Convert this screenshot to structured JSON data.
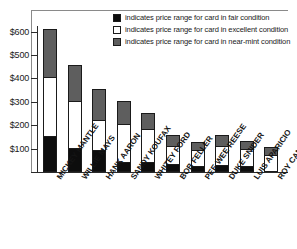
{
  "chart_data": {
    "type": "bar",
    "title": "",
    "subtitle": "",
    "xlabel": "",
    "ylabel": "",
    "stacked": true,
    "grid": false,
    "ylim": [
      0,
      640
    ],
    "yticks": [
      100,
      200,
      300,
      400,
      500,
      600
    ],
    "ytick_labels": [
      "$100",
      "$200",
      "$300",
      "$400",
      "$500",
      "$600"
    ],
    "legend_position": "top-right-inside",
    "categories": [
      "MICKEY MANTLE",
      "WILLIE MAYS",
      "HANK AARON",
      "SANDY KOUFAX",
      "WHITEY FORD",
      "BOB FELLER",
      "PEE WEE REESE",
      "DUKE SNIDER",
      "LUIS APARICIO",
      "ROY CAMPANELLA"
    ],
    "series": [
      {
        "name": "fair",
        "label": "indicates price range for card in fair condition",
        "color": "#0d0d0d",
        "values": [
          150,
          100,
          90,
          38,
          38,
          28,
          22,
          25,
          20,
          0
        ]
      },
      {
        "name": "excellent",
        "label": "indicates price range for card in excellent condition",
        "color": "#ffffff",
        "values": [
          250,
          200,
          130,
          162,
          142,
          77,
          68,
          80,
          75,
          70
        ]
      },
      {
        "name": "near-mint",
        "label": "indicates price range for card in near-mint condition",
        "color": "#5e5e5e",
        "values": [
          205,
          155,
          130,
          100,
          70,
          47,
          35,
          50,
          33,
          33
        ]
      }
    ],
    "cumulative_tops": [
      [
        150,
        400,
        605
      ],
      [
        100,
        300,
        455
      ],
      [
        90,
        220,
        350
      ],
      [
        38,
        200,
        300
      ],
      [
        38,
        180,
        250
      ],
      [
        28,
        105,
        152
      ],
      [
        22,
        90,
        125
      ],
      [
        25,
        105,
        155
      ],
      [
        20,
        95,
        128
      ],
      [
        0,
        70,
        103
      ]
    ],
    "totals": [
      605,
      455,
      350,
      300,
      250,
      152,
      125,
      155,
      128,
      103
    ]
  },
  "legend": {
    "items": [
      {
        "swatch": "fair-swatch",
        "text": "indicates price range for card in fair condition"
      },
      {
        "swatch": "excellent-swatch",
        "text": "indicates price range for card in excellent condition"
      },
      {
        "swatch": "nearmint-swatch",
        "text": "indicates price range for card in near-mint condition"
      }
    ]
  },
  "axis": {
    "y_labels": [
      "$600",
      "$500",
      "$400",
      "$300",
      "$200",
      "$100"
    ]
  }
}
